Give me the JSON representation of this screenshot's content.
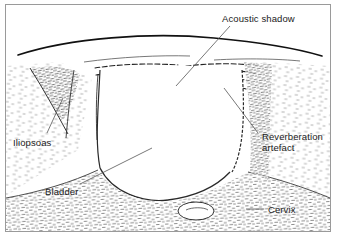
{
  "figure": {
    "kind": "ultrasound-line-drawing",
    "frame_color": "#9a9a9a",
    "ink_color": "#1a1a1a",
    "stipple_color": "#5a5a5a",
    "background": "#ffffff"
  },
  "labels": [
    {
      "id": "acoustic-shadow",
      "text": "Acoustic shadow",
      "line2": "",
      "x": 222,
      "y": 18,
      "align": "left"
    },
    {
      "id": "reverberation-artefact",
      "text": "Reverberation",
      "line2": "artefact",
      "x": 262,
      "y": 136,
      "align": "left"
    },
    {
      "id": "iliopsoas",
      "text": "Iliopsoas",
      "line2": "",
      "x": 13,
      "y": 140,
      "align": "left"
    },
    {
      "id": "bladder",
      "text": "Bladder",
      "line2": "",
      "x": 45,
      "y": 188,
      "align": "left"
    },
    {
      "id": "cervix",
      "text": "Cervix",
      "line2": "",
      "x": 266,
      "y": 206,
      "align": "left"
    }
  ],
  "structures": [
    {
      "id": "skin-surface",
      "name": "Skin / anterior abdominal wall interface"
    },
    {
      "id": "bladder-lumen",
      "name": "Anechoic bladder lumen"
    },
    {
      "id": "bladder-wall",
      "name": "Bladder wall"
    },
    {
      "id": "iliopsoas-muscle",
      "name": "Iliopsoas muscle"
    },
    {
      "id": "reverberation-bands",
      "name": "Reverberation artefact bands"
    },
    {
      "id": "acoustic-shadow-zone",
      "name": "Acoustic shadow"
    },
    {
      "id": "cervix-structure",
      "name": "Cervix"
    },
    {
      "id": "pelvic-tissue",
      "name": "Stippled pelvic soft tissue"
    }
  ],
  "leaders": [
    {
      "id": "leader-acoustic-shadow",
      "from": [
        230,
        26
      ],
      "to": [
        176,
        86
      ]
    },
    {
      "id": "leader-reverberation-artefact",
      "from": [
        258,
        133
      ],
      "to": [
        224,
        88
      ]
    },
    {
      "id": "leader-iliopsoas",
      "from": [
        47,
        133
      ],
      "to": [
        63,
        98
      ]
    },
    {
      "id": "leader-bladder",
      "from": [
        80,
        184
      ],
      "to": [
        152,
        148
      ]
    },
    {
      "id": "leader-cervix",
      "from": [
        264,
        209
      ],
      "to": [
        247,
        209
      ]
    }
  ]
}
